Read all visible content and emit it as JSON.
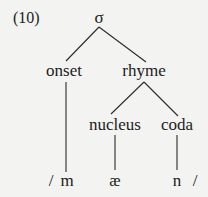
{
  "example_number": "(10)",
  "tree": {
    "root": "σ",
    "onset": "onset",
    "rhyme": "rhyme",
    "nucleus": "nucleus",
    "coda": "coda"
  },
  "segments": {
    "open_slash": "/",
    "m": "m",
    "ae": "æ",
    "n": "n",
    "close_slash": "/"
  }
}
